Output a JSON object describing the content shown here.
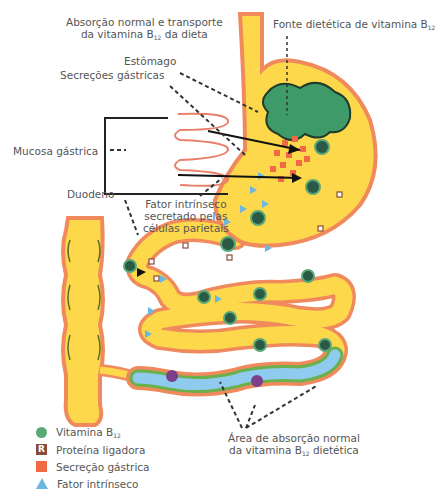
{
  "labels": {
    "normal_absorption_title_line1": "Absorção normal e transporte",
    "normal_absorption_title_line2_pre": "da vitamina B",
    "normal_absorption_title_line2_sub": "12",
    "normal_absorption_title_line2_post": " da dieta",
    "dietary_source_pre": "Fonte dietética de vitamina B",
    "dietary_source_sub": "12",
    "stomach": "Estômago",
    "gastric_secretions": "Secreções gástricas",
    "gastric_mucosa": "Mucosa gástrica",
    "duodenum": "Duodeno",
    "intrinsic_factor_line1": "Fator intrínseco",
    "intrinsic_factor_line2": "secretado pelas",
    "intrinsic_factor_line3": "células parietais",
    "absorption_area_line1": "Área de absorção normal",
    "absorption_area_line2_pre": "da vitamina B",
    "absorption_area_line2_sub": "12",
    "absorption_area_line2_post": " dietética"
  },
  "legend": {
    "items": [
      {
        "icon": "green-circle-icon",
        "label_pre": "Vitamina B",
        "label_sub": "12",
        "color": "#5aa878"
      },
      {
        "icon": "r-square-icon",
        "label_pre": "Proteína ligadora",
        "label_sub": "",
        "color": "#8b4a3a",
        "glyph": "R"
      },
      {
        "icon": "orange-square-icon",
        "label_pre": "Secreção gástrica",
        "label_sub": "",
        "color": "#f26a45"
      },
      {
        "icon": "blue-triangle-icon",
        "label_pre": "Fator intrínseco",
        "label_sub": "",
        "color": "#6bb7e0"
      }
    ]
  },
  "colors": {
    "organ_fill": "#fcd84a",
    "organ_outline": "#f08a5d",
    "food": "#3f9a6a",
    "ileum_lumen": "#8fcbef",
    "ileum_border": "#6ab04c",
    "absorbed_b12": "#7b3f8c",
    "mucosa_fold": "#e8806a"
  }
}
